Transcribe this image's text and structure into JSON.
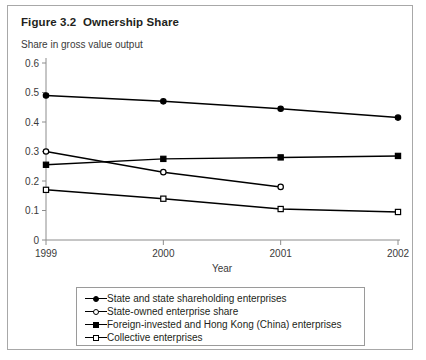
{
  "figure": {
    "title": "Figure 3.2  Ownership Share",
    "subtitle": "Share in gross value output"
  },
  "chart_data": {
    "type": "line",
    "title": "Figure 3.2  Ownership Share",
    "subtitle": "Share in gross value output",
    "xlabel": "Year",
    "ylabel": "",
    "x": [
      1999,
      2000,
      2001,
      2002
    ],
    "xticklabels": [
      "1999",
      "2000",
      "2001",
      "2002"
    ],
    "yticklabels": [
      "0",
      "0.1",
      "0.2",
      "0.3",
      "0.4",
      "0.5",
      "0.6"
    ],
    "yticks": [
      0,
      0.1,
      0.2,
      0.3,
      0.4,
      0.5,
      0.6
    ],
    "ylim": [
      0,
      0.6
    ],
    "xlim": [
      1999,
      2002
    ],
    "grid": false,
    "legend_position": "below-plot",
    "series": [
      {
        "name": "State and state shareholding enterprises",
        "marker": "filled-circle",
        "x": [
          1999,
          2000,
          2001,
          2002
        ],
        "values": [
          0.49,
          0.47,
          0.445,
          0.415
        ]
      },
      {
        "name": "State-owned enterprise share",
        "marker": "open-circle",
        "x": [
          1999,
          2000,
          2001
        ],
        "values": [
          0.3,
          0.23,
          0.18
        ]
      },
      {
        "name": "Foreign-invested and Hong Kong (China) enterprises",
        "marker": "filled-square",
        "x": [
          1999,
          2000,
          2001,
          2002
        ],
        "values": [
          0.255,
          0.275,
          0.28,
          0.285
        ]
      },
      {
        "name": "Collective enterprises",
        "marker": "open-square",
        "x": [
          1999,
          2000,
          2001,
          2002
        ],
        "values": [
          0.17,
          0.14,
          0.105,
          0.095
        ]
      }
    ]
  },
  "legend": {
    "items": [
      {
        "label": "State and state shareholding enterprises",
        "marker": "filled-circle"
      },
      {
        "label": "State-owned enterprise share",
        "marker": "open-circle"
      },
      {
        "label": "Foreign-invested and Hong Kong (China) enterprises",
        "marker": "filled-square"
      },
      {
        "label": "Collective enterprises",
        "marker": "open-square"
      }
    ]
  }
}
